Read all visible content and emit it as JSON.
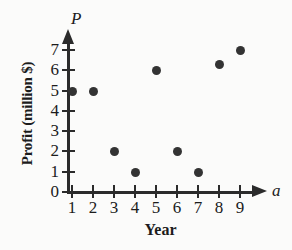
{
  "chart_data": {
    "type": "scatter",
    "title": "",
    "xlabel": "Year",
    "ylabel": "Profit (million $)",
    "x_variable": "a",
    "y_variable": "P",
    "x": [
      1,
      2,
      3,
      4,
      5,
      6,
      7,
      8,
      9
    ],
    "values": [
      5,
      5,
      2,
      1,
      6,
      2,
      1,
      6.3,
      7
    ],
    "points": [
      {
        "x": 1,
        "y": 5
      },
      {
        "x": 2,
        "y": 5
      },
      {
        "x": 3,
        "y": 2
      },
      {
        "x": 4,
        "y": 1
      },
      {
        "x": 5,
        "y": 6
      },
      {
        "x": 6,
        "y": 2
      },
      {
        "x": 7,
        "y": 1
      },
      {
        "x": 8,
        "y": 6.3
      },
      {
        "x": 9,
        "y": 7
      }
    ],
    "xticks": [
      "1",
      "2",
      "3",
      "4",
      "5",
      "6",
      "7",
      "8",
      "9"
    ],
    "yticks": [
      "0",
      "1",
      "2",
      "3",
      "4",
      "5",
      "6",
      "7"
    ],
    "xlim": [
      0,
      9.6
    ],
    "ylim": [
      0,
      7.5
    ],
    "grid": false,
    "legend": null,
    "marker_color": "#333333",
    "axis_color": "#2b2b2b",
    "background_color": "#fbfbfa"
  }
}
